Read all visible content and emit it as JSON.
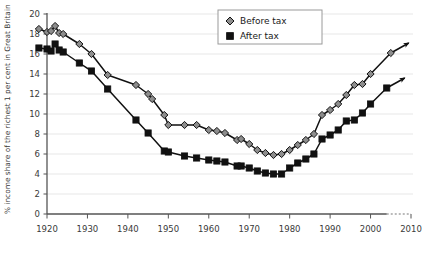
{
  "chart_data": {
    "type": "line",
    "title": "",
    "xlabel": "",
    "ylabel": "% income share of the richest 1 per cent in Great Britain",
    "xlim": [
      1918,
      2010
    ],
    "ylim": [
      0,
      20
    ],
    "xticks": [
      1920,
      1930,
      1940,
      1950,
      1960,
      1970,
      1980,
      1990,
      2000,
      2010
    ],
    "xtick_labels": [
      "1920",
      "1930",
      "1940",
      "1950",
      "1960",
      "1970",
      "1980",
      "1990",
      "2000",
      "2010"
    ],
    "yticks": [
      0,
      2,
      4,
      6,
      8,
      10,
      12,
      14,
      16,
      18,
      20
    ],
    "ytick_labels": [
      "0",
      "2",
      "4",
      "6",
      "8",
      "10",
      "12",
      "14",
      "16",
      "18",
      "20"
    ],
    "grid": "horizontal",
    "legend_position": "top-center",
    "series": [
      {
        "name": "Before tax",
        "marker": "diamond",
        "marker_color": "#8d8d8d",
        "line_color": "#111111",
        "points": [
          [
            1918,
            18.5
          ],
          [
            1920,
            18.2
          ],
          [
            1921,
            18.3
          ],
          [
            1922,
            18.8
          ],
          [
            1923,
            18.1
          ],
          [
            1924,
            18.0
          ],
          [
            1928,
            17.0
          ],
          [
            1931,
            16.0
          ],
          [
            1935,
            13.9
          ],
          [
            1942,
            12.9
          ],
          [
            1945,
            12.0
          ],
          [
            1946,
            11.5
          ],
          [
            1949,
            9.9
          ],
          [
            1950,
            8.9
          ],
          [
            1954,
            8.9
          ],
          [
            1957,
            8.9
          ],
          [
            1960,
            8.4
          ],
          [
            1962,
            8.3
          ],
          [
            1964,
            8.1
          ],
          [
            1967,
            7.4
          ],
          [
            1968,
            7.5
          ],
          [
            1970,
            7.0
          ],
          [
            1972,
            6.4
          ],
          [
            1974,
            6.1
          ],
          [
            1976,
            5.9
          ],
          [
            1978,
            6.0
          ],
          [
            1980,
            6.4
          ],
          [
            1982,
            6.9
          ],
          [
            1984,
            7.4
          ],
          [
            1986,
            8.0
          ],
          [
            1988,
            9.9
          ],
          [
            1990,
            10.4
          ],
          [
            1992,
            11.0
          ],
          [
            1994,
            11.9
          ],
          [
            1996,
            12.9
          ],
          [
            1998,
            13.0
          ],
          [
            2000,
            14.0
          ],
          [
            2005,
            16.1
          ]
        ],
        "last_value": 16.1,
        "trend_arrow": "up-right"
      },
      {
        "name": "After tax",
        "marker": "square",
        "marker_color": "#111111",
        "line_color": "#111111",
        "points": [
          [
            1918,
            16.6
          ],
          [
            1920,
            16.5
          ],
          [
            1921,
            16.3
          ],
          [
            1922,
            17.0
          ],
          [
            1923,
            16.4
          ],
          [
            1924,
            16.2
          ],
          [
            1928,
            15.1
          ],
          [
            1931,
            14.3
          ],
          [
            1935,
            12.5
          ],
          [
            1942,
            9.4
          ],
          [
            1945,
            8.1
          ],
          [
            1949,
            6.3
          ],
          [
            1950,
            6.2
          ],
          [
            1954,
            5.8
          ],
          [
            1957,
            5.6
          ],
          [
            1960,
            5.4
          ],
          [
            1962,
            5.3
          ],
          [
            1964,
            5.2
          ],
          [
            1967,
            4.8
          ],
          [
            1968,
            4.8
          ],
          [
            1970,
            4.6
          ],
          [
            1972,
            4.3
          ],
          [
            1974,
            4.1
          ],
          [
            1976,
            4.0
          ],
          [
            1978,
            4.0
          ],
          [
            1980,
            4.6
          ],
          [
            1982,
            5.1
          ],
          [
            1984,
            5.5
          ],
          [
            1986,
            6.0
          ],
          [
            1988,
            7.5
          ],
          [
            1990,
            7.9
          ],
          [
            1992,
            8.4
          ],
          [
            1994,
            9.3
          ],
          [
            1996,
            9.4
          ],
          [
            1998,
            10.1
          ],
          [
            2000,
            11.0
          ],
          [
            2004,
            12.6
          ]
        ],
        "last_value": 12.6,
        "trend_arrow": "up-right"
      }
    ],
    "axis_note": {
      "dotted_extension": true,
      "dotted_from": 2004,
      "dotted_to": 2010
    }
  },
  "legend": {
    "items": [
      {
        "label": "Before tax",
        "marker": "diamond",
        "color": "#8d8d8d"
      },
      {
        "label": "After tax",
        "marker": "square",
        "color": "#111111"
      }
    ]
  }
}
